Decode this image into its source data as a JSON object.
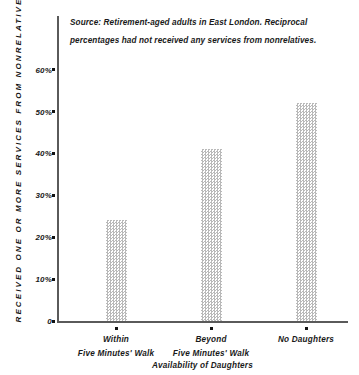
{
  "chart_data": {
    "type": "bar",
    "title": "",
    "categories": [
      "Within Five Minutes' Walk",
      "Beyond Five Minutes' Walk",
      "No Daughters"
    ],
    "category_lines": [
      [
        "Within",
        "Five Minutes' Walk"
      ],
      [
        "Beyond",
        "Five Minutes' Walk"
      ],
      [
        "No Daughters",
        ""
      ]
    ],
    "values": [
      24,
      41,
      52
    ],
    "xlabel": "Availability of Daughters",
    "ylabel": "RECEIVED ONE OR MORE SERVICES FROM NONRELATIVES",
    "ylim": [
      0,
      65
    ],
    "ytick_values": [
      0,
      10,
      20,
      30,
      40,
      50,
      60
    ],
    "ytick_labels": [
      "0",
      "10%",
      "20%",
      "30%",
      "40%",
      "50%",
      "60%"
    ],
    "grid": false,
    "legend": "none",
    "bar_fill": "#b9b9b9",
    "axis_color": "#5a5a5a",
    "annotations": [
      "Source: Retirement-aged adults in East London. Reciprocal",
      "percentages had not received any services from  nonrelatives."
    ]
  },
  "source_note": {
    "line1": "Source: Retirement-aged adults in East London. Reciprocal",
    "line2": "percentages had not received any services from  nonrelatives."
  }
}
